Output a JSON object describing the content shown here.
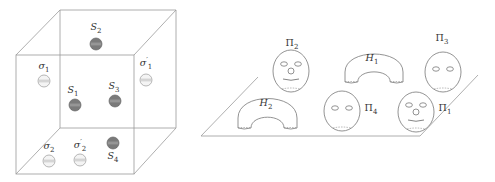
{
  "left_panel": {
    "cube": {
      "front": {
        "x1": 16,
        "y1": 55,
        "x2": 134,
        "y2": 174
      },
      "back": {
        "x1": 60,
        "y1": 10,
        "x2": 176,
        "y2": 128
      },
      "edge_color": "#9a9a9a"
    },
    "spheres": [
      {
        "id": "S2",
        "label": "S",
        "sub": "2",
        "prime": false,
        "cx": 96,
        "cy": 44,
        "dark": true,
        "lx": 96,
        "ly": 30
      },
      {
        "id": "sigma1",
        "label": "σ",
        "sub": "1",
        "prime": false,
        "cx": 44,
        "cy": 81,
        "dark": false,
        "lx": 44,
        "ly": 69
      },
      {
        "id": "sigma1p",
        "label": "σ",
        "sub": "1",
        "prime": true,
        "cx": 146,
        "cy": 80,
        "dark": false,
        "lx": 146,
        "ly": 66
      },
      {
        "id": "S1",
        "label": "S",
        "sub": "1",
        "prime": false,
        "cx": 75,
        "cy": 105,
        "dark": true,
        "lx": 73,
        "ly": 93
      },
      {
        "id": "S3",
        "label": "S",
        "sub": "3",
        "prime": false,
        "cx": 115,
        "cy": 101,
        "dark": true,
        "lx": 114,
        "ly": 89
      },
      {
        "id": "S4",
        "label": "S",
        "sub": "4",
        "prime": false,
        "cx": 113,
        "cy": 143,
        "dark": true,
        "lx": 113,
        "ly": 159
      },
      {
        "id": "sigma2",
        "label": "σ",
        "sub": "2",
        "prime": false,
        "cx": 49,
        "cy": 161,
        "dark": false,
        "lx": 49,
        "ly": 149
      },
      {
        "id": "sigma2p",
        "label": "σ",
        "sub": "2",
        "prime": true,
        "cx": 80,
        "cy": 160,
        "dark": false,
        "lx": 80,
        "ly": 148
      }
    ],
    "colors": {
      "dark_fill": "#7a7a7a",
      "light_fill": "#f4f4f4"
    }
  },
  "right_panel": {
    "plane": {
      "points": "258,77 478,75 420,136 201,136"
    },
    "arches": [
      {
        "id": "H1",
        "label": "H",
        "sub": "1",
        "x": 345,
        "w": 58,
        "top": 52,
        "base": 82,
        "lx": 372,
        "ly": 61
      },
      {
        "id": "H2",
        "label": "H",
        "sub": "2",
        "x": 238,
        "w": 59,
        "top": 96,
        "base": 128,
        "lx": 266,
        "ly": 106
      }
    ],
    "faces": [
      {
        "id": "Pi2",
        "label": "Π",
        "sub": "2",
        "cx": 291,
        "cy": 71,
        "rx": 18,
        "ry": 21,
        "nose": true,
        "mouth": true,
        "lx": 292,
        "ly": 46
      },
      {
        "id": "Pi3",
        "label": "Π",
        "sub": "3",
        "cx": 443,
        "cy": 72,
        "rx": 18,
        "ry": 20,
        "nose": false,
        "mouth": false,
        "lx": 442,
        "ly": 41
      },
      {
        "id": "Pi4",
        "label": "Π",
        "sub": "4",
        "cx": 342,
        "cy": 111,
        "rx": 18,
        "ry": 20,
        "nose": false,
        "mouth": false,
        "lx": 371,
        "ly": 111
      },
      {
        "id": "Pi1",
        "label": "Π",
        "sub": "1",
        "cx": 416,
        "cy": 112,
        "rx": 18,
        "ry": 20,
        "nose": true,
        "mouth": true,
        "lx": 445,
        "ly": 111
      }
    ]
  }
}
